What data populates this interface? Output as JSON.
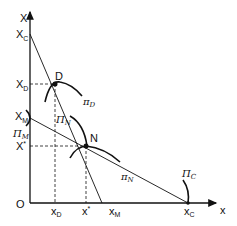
{
  "diagram": {
    "axes": {
      "y_label": "X",
      "x_label": "x",
      "origin": "O"
    },
    "y_ticks": [
      {
        "main": "X",
        "sub": "C"
      },
      {
        "main": "X",
        "sub": "D"
      },
      {
        "main": "X",
        "sub": "M"
      },
      {
        "main": "X",
        "sub": "*"
      }
    ],
    "x_ticks": [
      {
        "main": "x",
        "sub": "D"
      },
      {
        "main": "x",
        "sub": "*"
      },
      {
        "main": "x",
        "sub": "M"
      },
      {
        "main": "x",
        "sub": "C"
      }
    ],
    "points": [
      {
        "label": "D"
      },
      {
        "label": "N"
      }
    ],
    "curve_labels": {
      "pi_D": {
        "main": "π",
        "sub": "D"
      },
      "Pi_N": {
        "main": "Π",
        "sub": "N"
      },
      "Pi_M": {
        "main": "Π",
        "sub": "M"
      },
      "pi_N": {
        "main": "π",
        "sub": "N"
      },
      "Pi_C": {
        "main": "Π",
        "sub": "C"
      }
    }
  }
}
